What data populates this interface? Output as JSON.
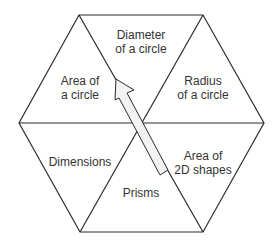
{
  "diagram": {
    "shape": "hexagon divided into six triangles",
    "colors": {
      "line": "#2b2b2b",
      "background": "#ffffff",
      "arrow_fill": "#f2f2f2",
      "text": "#333333"
    },
    "segments": [
      {
        "id": "top",
        "lines": [
          "Diameter",
          "of a circle"
        ]
      },
      {
        "id": "upper-right",
        "lines": [
          "Radius",
          "of a circle"
        ]
      },
      {
        "id": "lower-right",
        "lines": [
          "Area of",
          "2D shapes"
        ]
      },
      {
        "id": "bottom",
        "lines": [
          "Prisms"
        ]
      },
      {
        "id": "lower-left",
        "lines": [
          "Dimensions"
        ]
      },
      {
        "id": "upper-left",
        "lines": [
          "Area of",
          "a circle"
        ]
      }
    ],
    "arrow": {
      "from": "Area of 2D shapes",
      "to": "Area of a circle",
      "style": "hollow block arrow"
    }
  }
}
